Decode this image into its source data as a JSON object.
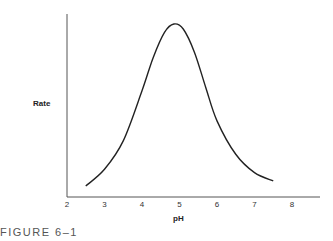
{
  "chart_data": {
    "type": "line",
    "title": "",
    "caption": "FIGURE 6–1",
    "xlabel": "pH",
    "ylabel": "Rate",
    "x_ticks": [
      "2",
      "3",
      "4",
      "5",
      "6",
      "7",
      "8"
    ],
    "xlim": [
      2,
      8.8
    ],
    "ylim": [
      0,
      1
    ],
    "grid": false,
    "legend": null,
    "series": [
      {
        "name": "Rate vs pH",
        "x": [
          2.5,
          3.0,
          3.5,
          4.0,
          4.3,
          4.6,
          4.85,
          5.1,
          5.4,
          5.7,
          6.0,
          6.5,
          7.0,
          7.5
        ],
        "y": [
          0.03,
          0.13,
          0.3,
          0.6,
          0.8,
          0.95,
          1.0,
          0.97,
          0.83,
          0.62,
          0.42,
          0.22,
          0.11,
          0.06
        ]
      }
    ],
    "annotations": "Bell-shaped curve peaking near pH 4.8–5; y-axis unlabeled numerically"
  },
  "colors": {
    "curve": "#222222",
    "axis": "#444444",
    "caption": "#555555"
  }
}
